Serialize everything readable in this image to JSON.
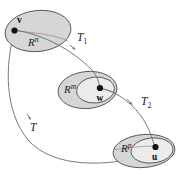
{
  "figure": {
    "background_color": "#ffffff",
    "outline_color": "#4d4d4d",
    "fill_outer": "#d6d6d6",
    "fill_inner": "#ececec",
    "curve_color": "#6b6b6b",
    "point_color": "#111111",
    "text_color": "#1a1a1a"
  },
  "spaces": [
    {
      "id": "domain-space",
      "label_base": "R",
      "label_exponent": "n",
      "label_full": "R^n",
      "position": "top-left"
    },
    {
      "id": "middle-space",
      "label_base": "R",
      "label_exponent": "m",
      "label_full": "R^m",
      "position": "center"
    },
    {
      "id": "codomain-space",
      "label_base": "R",
      "label_exponent": "p",
      "label_full": "R^p",
      "position": "bottom-right"
    }
  ],
  "points": [
    {
      "id": "point-v",
      "label": "v",
      "space": "R^n"
    },
    {
      "id": "point-w",
      "label": "w",
      "space": "R^m"
    },
    {
      "id": "point-u",
      "label": "u",
      "space": "R^p"
    }
  ],
  "maps": [
    {
      "id": "map-t1",
      "label_base": "T",
      "label_subscript": "1",
      "label_full": "T₁",
      "from": "R^n",
      "to": "R^m"
    },
    {
      "id": "map-t2",
      "label_base": "T",
      "label_subscript": "2",
      "label_full": "T₂",
      "from": "R^m",
      "to": "R^p"
    },
    {
      "id": "map-t",
      "label_base": "T",
      "label_subscript": "",
      "label_full": "T",
      "from": "R^n",
      "to": "R^p"
    }
  ]
}
